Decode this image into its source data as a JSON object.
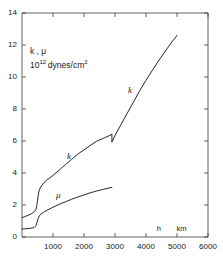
{
  "chart_data": {
    "type": "line",
    "title": "",
    "subtitle": "",
    "ylabel_line1": "k , μ",
    "ylabel_line2_mantissa": "10",
    "ylabel_line2_exponent": "12",
    "ylabel_line2_unit": "dynes/cm",
    "ylabel_line2_unit_exponent": "2",
    "xlabel_symbol": "h",
    "xlabel_unit": "km",
    "xlim": [
      0,
      6000
    ],
    "ylim": [
      0,
      14
    ],
    "xticks": [
      1000,
      2000,
      3000,
      4000,
      5000,
      6000
    ],
    "xtick_labels": [
      "1000",
      "2000",
      "3000",
      "4000",
      "5000",
      "6000"
    ],
    "yticks": [
      0,
      2,
      4,
      6,
      8,
      10,
      12,
      14
    ],
    "ytick_labels": [
      "0",
      "2",
      "4",
      "6",
      "8",
      "10",
      "12",
      "14"
    ],
    "grid": false,
    "legend": "inline-curve-labels",
    "annotations": [
      {
        "text": "k",
        "x": 1550,
        "y": 5.0,
        "name": "k-curve-label-lower"
      },
      {
        "text": "k",
        "x": 3520,
        "y": 9.1,
        "name": "k-curve-label-upper"
      },
      {
        "text": "μ",
        "x": 1190,
        "y": 2.55,
        "name": "mu-curve-label"
      }
    ],
    "series": [
      {
        "name": "k",
        "label": "k",
        "color": "#1a1a1a",
        "discontinuity_at_x": 2900,
        "points": [
          [
            0,
            1.2
          ],
          [
            100,
            1.28
          ],
          [
            200,
            1.36
          ],
          [
            300,
            1.45
          ],
          [
            400,
            1.58
          ],
          [
            450,
            1.72
          ],
          [
            480,
            1.95
          ],
          [
            500,
            2.3
          ],
          [
            530,
            2.7
          ],
          [
            560,
            2.95
          ],
          [
            600,
            3.12
          ],
          [
            700,
            3.38
          ],
          [
            800,
            3.56
          ],
          [
            900,
            3.7
          ],
          [
            1000,
            3.85
          ],
          [
            1200,
            4.18
          ],
          [
            1400,
            4.52
          ],
          [
            1600,
            4.85
          ],
          [
            1800,
            5.18
          ],
          [
            2000,
            5.45
          ],
          [
            2200,
            5.72
          ],
          [
            2400,
            5.98
          ],
          [
            2600,
            6.15
          ],
          [
            2800,
            6.32
          ],
          [
            2900,
            6.42
          ]
        ],
        "points_after_jump": [
          [
            2900,
            5.95
          ],
          [
            3000,
            6.35
          ],
          [
            3200,
            7.05
          ],
          [
            3400,
            7.75
          ],
          [
            3600,
            8.45
          ],
          [
            3800,
            9.15
          ],
          [
            4000,
            9.8
          ],
          [
            4200,
            10.4
          ],
          [
            4400,
            11.0
          ],
          [
            4600,
            11.55
          ],
          [
            4800,
            12.1
          ],
          [
            5000,
            12.6
          ]
        ]
      },
      {
        "name": "mu",
        "label": "μ",
        "color": "#1a1a1a",
        "points": [
          [
            0,
            0.5
          ],
          [
            150,
            0.52
          ],
          [
            300,
            0.55
          ],
          [
            400,
            0.6
          ],
          [
            450,
            0.7
          ],
          [
            480,
            0.9
          ],
          [
            520,
            1.15
          ],
          [
            560,
            1.32
          ],
          [
            600,
            1.42
          ],
          [
            700,
            1.55
          ],
          [
            800,
            1.66
          ],
          [
            900,
            1.76
          ],
          [
            1000,
            1.86
          ],
          [
            1200,
            2.04
          ],
          [
            1400,
            2.2
          ],
          [
            1600,
            2.36
          ],
          [
            1800,
            2.5
          ],
          [
            2000,
            2.63
          ],
          [
            2200,
            2.76
          ],
          [
            2400,
            2.87
          ],
          [
            2600,
            2.97
          ],
          [
            2800,
            3.06
          ],
          [
            2900,
            3.1
          ]
        ]
      }
    ]
  },
  "axes_geometry": {
    "left_px": 22,
    "right_px": 208,
    "top_px": 13,
    "bottom_px": 237
  }
}
